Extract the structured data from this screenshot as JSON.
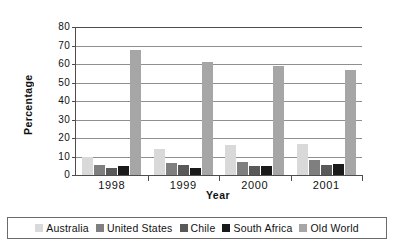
{
  "chart_data": {
    "type": "bar",
    "title": "",
    "xlabel": "Year",
    "ylabel": "Percentage",
    "categories": [
      "1998",
      "1999",
      "2000",
      "2001"
    ],
    "ylim": [
      0,
      80
    ],
    "yticks": [
      0,
      10,
      20,
      30,
      40,
      50,
      60,
      70,
      80
    ],
    "grid": true,
    "legend_position": "bottom",
    "series": [
      {
        "name": "Australia",
        "color": "#d9d9d9",
        "values": [
          10.0,
          14.0,
          16.0,
          16.5
        ]
      },
      {
        "name": "United States",
        "color": "#7f7f7f",
        "values": [
          5.5,
          6.5,
          7.0,
          8.0
        ]
      },
      {
        "name": "Chile",
        "color": "#595959",
        "values": [
          4.0,
          5.5,
          5.0,
          5.5
        ]
      },
      {
        "name": "South Africa",
        "color": "#1a1a1a",
        "values": [
          5.0,
          4.0,
          5.0,
          6.0
        ]
      },
      {
        "name": "Old World",
        "color": "#a6a6a6",
        "values": [
          67.5,
          61.0,
          59.0,
          56.5
        ]
      }
    ]
  },
  "legend": {
    "items": [
      {
        "label": "Australia"
      },
      {
        "label": "United States"
      },
      {
        "label": "Chile"
      },
      {
        "label": "South Africa"
      },
      {
        "label": "Old World"
      }
    ]
  }
}
